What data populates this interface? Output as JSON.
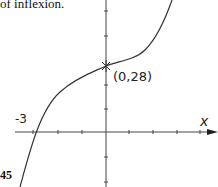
{
  "caption": "of inflexion.",
  "page_number_fragment": "45",
  "labels": {
    "point": "(0,28)",
    "x_intercept": "-3",
    "x_axis": "x"
  },
  "colors": {
    "ink": "#222222",
    "background": "#ffffff"
  },
  "diagram": {
    "type": "cubic curve sketch",
    "point_of_inflexion": {
      "x": 0,
      "y": 28
    },
    "x_intercept": -3,
    "y_intercept": 28
  }
}
